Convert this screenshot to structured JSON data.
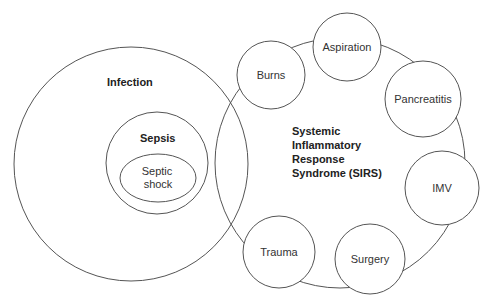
{
  "diagram": {
    "type": "venn-and-cluster",
    "colors": {
      "stroke": "#555555",
      "text": "#333333",
      "background": "#ffffff"
    },
    "infection": {
      "label": "Infection"
    },
    "sepsis": {
      "label": "Sepsis"
    },
    "septic_shock": {
      "label_line1": "Septic",
      "label_line2": "shock"
    },
    "sirs": {
      "label_line1": "Systemic",
      "label_line2": "Inflammatory",
      "label_line3": "Response",
      "label_line4": "Syndrome (SIRS)"
    },
    "causes": [
      {
        "label": "Burns"
      },
      {
        "label": "Aspiration"
      },
      {
        "label": "Pancreatitis"
      },
      {
        "label": "IMV"
      },
      {
        "label": "Surgery"
      },
      {
        "label": "Trauma"
      }
    ]
  }
}
